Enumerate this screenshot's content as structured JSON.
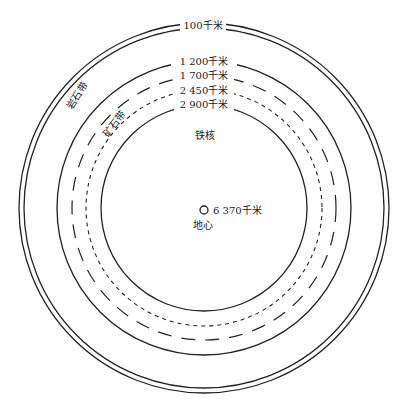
{
  "diagram": {
    "type": "concentric-layers",
    "center": {
      "x": 204,
      "y": 208
    },
    "stroke_color": "#222222",
    "layers": [
      {
        "name": "outer-crust-a",
        "radius": 184,
        "style": "solid"
      },
      {
        "name": "outer-crust-b",
        "radius": 179,
        "style": "solid",
        "label": "100千米"
      },
      {
        "name": "layer-1200",
        "radius": 147,
        "style": "solid",
        "label": "1 200千米"
      },
      {
        "name": "layer-1700",
        "radius": 132,
        "style": "dashed",
        "label": "1 700千米"
      },
      {
        "name": "layer-2450",
        "radius": 118,
        "style": "dotted",
        "label": "2 450千米"
      },
      {
        "name": "layer-2900",
        "radius": 103,
        "style": "solid",
        "label": "2 900千米"
      }
    ],
    "zone_labels": {
      "rock_zone": "岩石带",
      "ore_zone": "矿石带",
      "iron_core": "铁核",
      "center_depth": "6 370千米",
      "center_name": "地心"
    }
  }
}
